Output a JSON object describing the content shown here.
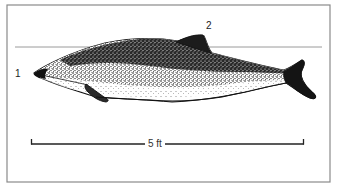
{
  "figure": {
    "labels": [
      {
        "id": "1",
        "text": "1"
      },
      {
        "id": "2",
        "text": "2"
      }
    ],
    "scale_bar": {
      "text": "5 ft"
    },
    "colors": {
      "frame": "#8a8a8a",
      "reference_line": "#9a9a9a",
      "ink": "#111111",
      "belly": "#ffffff",
      "background": "#ffffff"
    }
  }
}
